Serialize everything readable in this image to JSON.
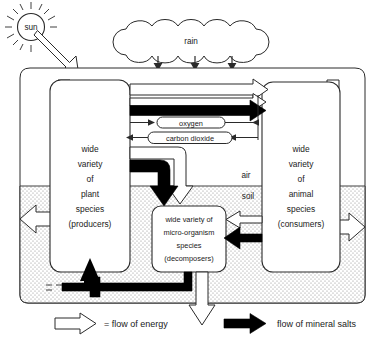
{
  "diagram": {
    "sun": {
      "label": "sun",
      "icon": "sun-icon"
    },
    "cloud": {
      "label": "rain",
      "icon": "cloud-icon",
      "drops": 3
    },
    "gases": [
      {
        "id": "oxygen",
        "label": "oxygen"
      },
      {
        "id": "carbon-dioxide",
        "label": "carbon dioxide"
      }
    ],
    "zones": [
      {
        "id": "air",
        "label": "air"
      },
      {
        "id": "soil",
        "label": "soil"
      }
    ],
    "boxes": [
      {
        "id": "producers",
        "lines": [
          "wide",
          "variety",
          "of",
          "plant",
          "species",
          "(producers)"
        ]
      },
      {
        "id": "consumers",
        "lines": [
          "wide",
          "variety",
          "of",
          "animal",
          "species",
          "(consumers)"
        ]
      },
      {
        "id": "decomposers",
        "lines": [
          "wide variety of",
          "micro-organism",
          "species",
          "(decomposers)"
        ]
      }
    ],
    "legend": [
      {
        "id": "energy",
        "icon": "white-arrow-icon",
        "label": "= flow of energy",
        "color": "#ffffff"
      },
      {
        "id": "mineral-salts",
        "icon": "black-arrow-icon",
        "label": "flow of mineral salts",
        "color": "#000000"
      }
    ],
    "colors": {
      "outline": "#2a2a2a",
      "energy_arrow_fill": "#ffffff",
      "mineral_arrow_fill": "#000000",
      "soil_stipple": "#9a9a9a",
      "background": "#ffffff"
    }
  }
}
